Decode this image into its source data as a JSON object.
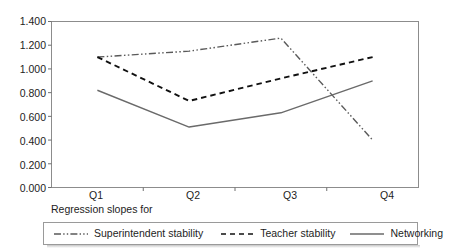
{
  "chart_data": {
    "type": "line",
    "title": "",
    "subtitle": "",
    "caption": "Regression slopes for",
    "xlabel": "",
    "ylabel": "",
    "categories": [
      "Q1",
      "Q2",
      "Q3",
      "Q4"
    ],
    "ylim": [
      0.0,
      1.4
    ],
    "yticks": [
      "0.000",
      "0.200",
      "0.400",
      "0.600",
      "0.800",
      "1.000",
      "1.200",
      "1.400"
    ],
    "ytick_values": [
      0.0,
      0.2,
      0.4,
      0.6,
      0.8,
      1.0,
      1.2,
      1.4
    ],
    "grid": false,
    "legend_position": "bottom",
    "series": [
      {
        "name": "Superintendent stability",
        "style": "dash-dot",
        "color": "#5a5a5a",
        "values": [
          1.1,
          1.15,
          1.26,
          0.4
        ]
      },
      {
        "name": "Teacher stability",
        "style": "dashed",
        "color": "#111111",
        "values": [
          1.1,
          0.73,
          0.92,
          1.1
        ]
      },
      {
        "name": "Networking",
        "style": "solid",
        "color": "#6a6a6a",
        "values": [
          0.82,
          0.51,
          0.63,
          0.9
        ]
      }
    ]
  },
  "axis": {
    "y_tick_0": "0.000",
    "y_tick_1": "0.200",
    "y_tick_2": "0.400",
    "y_tick_3": "0.600",
    "y_tick_4": "0.800",
    "y_tick_5": "1.000",
    "y_tick_6": "1.200",
    "y_tick_7": "1.400",
    "x_tick_0": "Q1",
    "x_tick_1": "Q2",
    "x_tick_2": "Q3",
    "x_tick_3": "Q4"
  },
  "legend": {
    "items": [
      {
        "label": "Superintendent stability"
      },
      {
        "label": "Teacher stability"
      },
      {
        "label": "Networking"
      }
    ]
  },
  "colors": {
    "plot_border": "#8c8c8c",
    "axis": "#6f6f6f",
    "superintendent": "#5a5a5a",
    "teacher": "#111111",
    "networking": "#6a6a6a",
    "legend_border": "#9a9a9a"
  }
}
